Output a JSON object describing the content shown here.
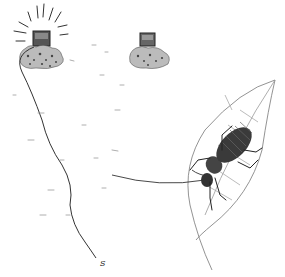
{
  "illustration": {
    "style": "pen-and-ink sketch",
    "colors": {
      "ink": "#222222",
      "light_ink": "#888888",
      "background": "#ffffff"
    },
    "label": "S"
  }
}
